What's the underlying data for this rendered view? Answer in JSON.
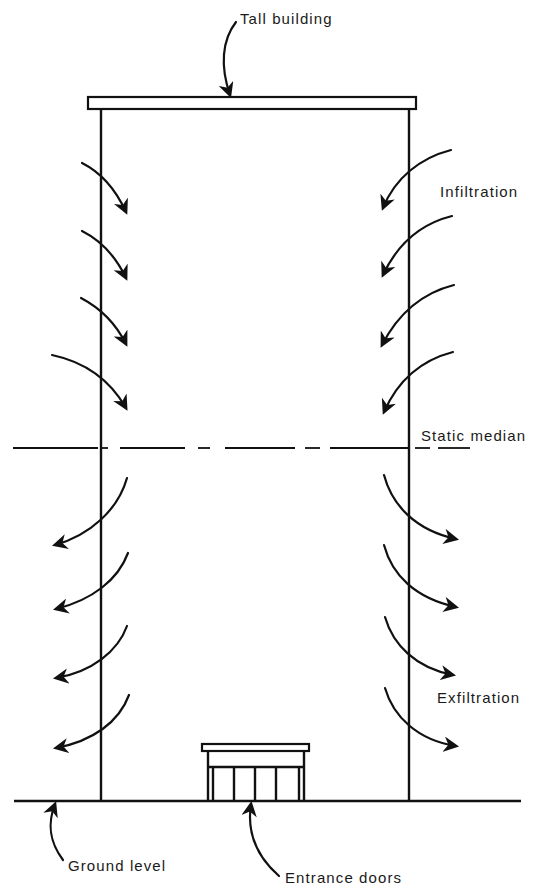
{
  "diagram": {
    "labels": {
      "building": "Tall building",
      "infiltration": "Infiltration",
      "static_median": "Static median",
      "exfiltration": "Exfiltration",
      "ground": "Ground level",
      "entrance": "Entrance doors"
    },
    "colors": {
      "ink": "#111111",
      "background": "#ffffff"
    },
    "arrows": {
      "infiltration_count_per_side": 4,
      "exfiltration_count_per_side": 4
    }
  }
}
